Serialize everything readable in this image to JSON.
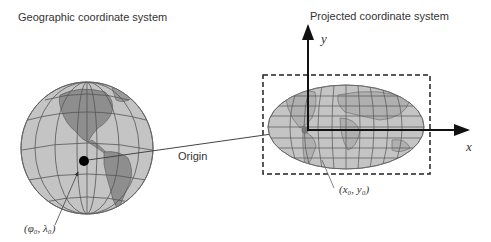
{
  "diagram": {
    "left_title": "Geographic coordinate system",
    "right_title": "Projected coordinate system",
    "origin_label": "Origin",
    "geo_origin_label": "(φ₀, λ₀)",
    "proj_origin_label": "(x₀, y₀)",
    "x_axis_label": "x",
    "y_axis_label": "y"
  },
  "colors": {
    "globe_fill": "#b8b8b8",
    "land_fill": "#8e8e8e",
    "grid_line": "#555555",
    "axis": "#111111",
    "dashed_box": "#222222"
  }
}
